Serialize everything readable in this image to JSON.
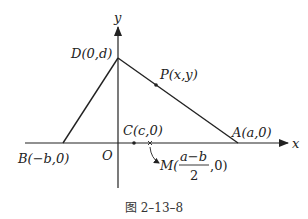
{
  "figure": {
    "caption": "图 2–13–8",
    "axes": {
      "x_label": "x",
      "y_label": "y",
      "origin_label": "O"
    },
    "points": {
      "D": {
        "label": "D(0,d)"
      },
      "A": {
        "label": "A(a,0)"
      },
      "B": {
        "label": "B(−b,0)"
      },
      "C": {
        "label": "C(c,0)"
      },
      "P": {
        "label": "P(x,y)"
      },
      "M": {
        "prefix": "M(",
        "numerator": "a−b",
        "denominator": "2",
        "suffix": ",0)"
      }
    },
    "colors": {
      "line": "#222222",
      "background": "#ffffff"
    }
  }
}
